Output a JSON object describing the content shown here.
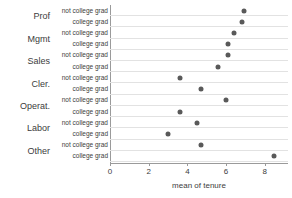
{
  "chart_data": {
    "type": "scatter",
    "title": "",
    "xlabel": "mean of tenure",
    "ylabel": "",
    "xlim": [
      0,
      9.2
    ],
    "xticks": [
      0,
      2,
      4,
      6,
      8
    ],
    "xtick_labels": [
      "0",
      "2",
      "4",
      "6",
      "8"
    ],
    "grid": "horizontal",
    "legend": "none",
    "categories": [
      "Prof",
      "Mgmt",
      "Sales",
      "Cler.",
      "Operat.",
      "Labor",
      "Other"
    ],
    "series_labels": [
      "not college grad",
      "college grad"
    ],
    "rows": [
      {
        "category": "Prof",
        "series": "not college grad",
        "value": 6.9
      },
      {
        "category": "Prof",
        "series": "college grad",
        "value": 6.8
      },
      {
        "category": "Mgmt",
        "series": "not college grad",
        "value": 6.4
      },
      {
        "category": "Mgmt",
        "series": "college grad",
        "value": 6.1
      },
      {
        "category": "Sales",
        "series": "not college grad",
        "value": 6.1
      },
      {
        "category": "Sales",
        "series": "college grad",
        "value": 5.6
      },
      {
        "category": "Cler.",
        "series": "not college grad",
        "value": 3.6
      },
      {
        "category": "Cler.",
        "series": "college grad",
        "value": 4.7
      },
      {
        "category": "Operat.",
        "series": "not college grad",
        "value": 6.0
      },
      {
        "category": "Operat.",
        "series": "college grad",
        "value": 3.6
      },
      {
        "category": "Labor",
        "series": "not college grad",
        "value": 4.5
      },
      {
        "category": "Labor",
        "series": "college grad",
        "value": 3.0
      },
      {
        "category": "Other",
        "series": "not college grad",
        "value": 4.7
      },
      {
        "category": "Other",
        "series": "college grad",
        "value": 8.5
      }
    ],
    "series": [
      {
        "name": "not college grad",
        "categories": [
          "Prof",
          "Mgmt",
          "Sales",
          "Cler.",
          "Operat.",
          "Labor",
          "Other"
        ],
        "values": [
          6.9,
          6.4,
          6.1,
          3.6,
          6.0,
          4.5,
          4.7
        ]
      },
      {
        "name": "college grad",
        "categories": [
          "Prof",
          "Mgmt",
          "Sales",
          "Cler.",
          "Operat.",
          "Labor",
          "Other"
        ],
        "values": [
          6.8,
          6.1,
          5.6,
          4.7,
          3.6,
          3.0,
          8.5
        ]
      }
    ],
    "marker_color": "#595959",
    "gridline_color": "#e2e2e2",
    "axis_color": "#9a9a9a"
  }
}
